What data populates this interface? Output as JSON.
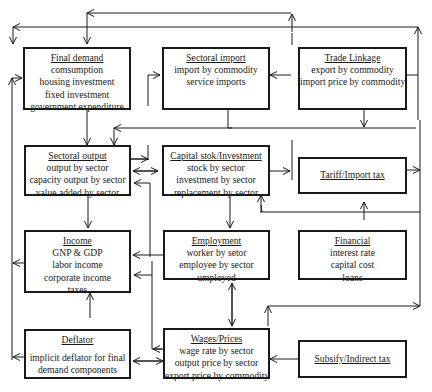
{
  "diagram": {
    "type": "flow-model",
    "boxes": [
      {
        "id": "final_demand",
        "title": "Final demand",
        "lines": [
          "comsumption",
          "housing investment",
          "fixed investment",
          "government expenditure"
        ]
      },
      {
        "id": "sectoral_import",
        "title": "Sectoral import",
        "lines": [
          "import by commodity",
          "service imports"
        ]
      },
      {
        "id": "trade_linkage",
        "title": "Trade Linkage",
        "lines": [
          "export by commodity",
          "import price by commodity"
        ]
      },
      {
        "id": "sectoral_output",
        "title": "Sectoral output",
        "lines": [
          "output by sector",
          "capacity output by sector",
          "value added by sector"
        ]
      },
      {
        "id": "capital_stock",
        "title": "Capital stok/Investment",
        "lines": [
          "stock by sector",
          "investment by sector",
          "replacement by sector"
        ]
      },
      {
        "id": "tariff",
        "title": "Tariff/Import tax",
        "lines": []
      },
      {
        "id": "income",
        "title": "Income",
        "lines": [
          "GNP & GDP",
          "labor income",
          "corporate income",
          "taxes"
        ]
      },
      {
        "id": "employment",
        "title": "Employment",
        "lines": [
          "worker by setor",
          "employee by sector",
          "umployed"
        ]
      },
      {
        "id": "financial",
        "title": "Financial",
        "lines": [
          "interest rate",
          "capital cost",
          "loans"
        ]
      },
      {
        "id": "deflator",
        "title": "Deflator",
        "lines": [
          "implicit deflator for final",
          "demand components"
        ]
      },
      {
        "id": "wages_prices",
        "title": "Wages/Prices",
        "lines": [
          "wage rate by sector",
          "output price by sector",
          "export price by commodity"
        ]
      },
      {
        "id": "subsidy",
        "title": "Subsify/Indirect tax",
        "lines": []
      }
    ],
    "colors": {
      "stroke": "#1a1a1a",
      "background": "#ffffff"
    }
  }
}
